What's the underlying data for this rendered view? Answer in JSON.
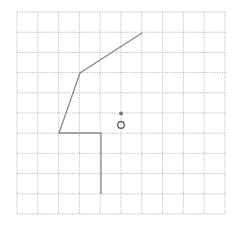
{
  "diagram": {
    "grid": {
      "columns": 10,
      "rows": 10,
      "x0": 17,
      "y0": 12,
      "x1": 225,
      "y1": 214,
      "line_color": "#b5b5b5",
      "dash": "1.2,1.3"
    },
    "path": {
      "points": [
        [
          142,
          33
        ],
        [
          80,
          73
        ],
        [
          59,
          133
        ],
        [
          101,
          133
        ],
        [
          101,
          194
        ]
      ],
      "color": "#8a8a8a",
      "width": 1.3
    },
    "dot": {
      "cx": 121,
      "cy": 113.5,
      "r": 2,
      "color": "#777777"
    },
    "ring": {
      "cx": 121,
      "cy": 125,
      "r": 3.3,
      "color": "#555555",
      "width": 1.3
    }
  }
}
